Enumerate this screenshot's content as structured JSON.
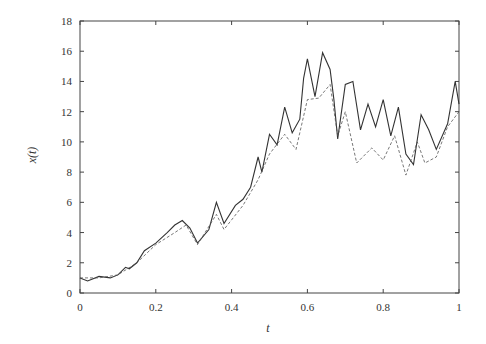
{
  "chart_data": {
    "type": "line",
    "title": "",
    "xlabel": "t",
    "ylabel": "x(t)",
    "xlim": [
      0,
      1
    ],
    "ylim": [
      0,
      18
    ],
    "grid": false,
    "legend": null,
    "x_ticks": [
      0,
      0.2,
      0.4,
      0.6,
      0.8,
      1
    ],
    "x_tick_labels": [
      "0",
      "0.2",
      "0.4",
      "0.6",
      "0.8",
      "1"
    ],
    "y_ticks": [
      0,
      2,
      4,
      6,
      8,
      10,
      12,
      14,
      16,
      18
    ],
    "y_tick_labels": [
      "0",
      "2",
      "4",
      "6",
      "8",
      "10",
      "12",
      "14",
      "16",
      "18"
    ],
    "series": [
      {
        "name": "solid",
        "style": "solid",
        "color": "#333333",
        "x": [
          0,
          0.02,
          0.05,
          0.08,
          0.1,
          0.12,
          0.13,
          0.15,
          0.17,
          0.2,
          0.23,
          0.25,
          0.27,
          0.29,
          0.31,
          0.34,
          0.36,
          0.38,
          0.41,
          0.43,
          0.45,
          0.47,
          0.48,
          0.5,
          0.52,
          0.54,
          0.56,
          0.58,
          0.59,
          0.6,
          0.62,
          0.64,
          0.66,
          0.67,
          0.68,
          0.7,
          0.72,
          0.74,
          0.76,
          0.78,
          0.8,
          0.82,
          0.84,
          0.86,
          0.88,
          0.9,
          0.92,
          0.94,
          0.97,
          0.99,
          1.0
        ],
        "values": [
          1.0,
          0.8,
          1.1,
          1.0,
          1.2,
          1.7,
          1.6,
          2.0,
          2.8,
          3.3,
          4.0,
          4.5,
          4.8,
          4.3,
          3.3,
          4.2,
          6.0,
          4.6,
          5.8,
          6.2,
          7.0,
          9.0,
          8.0,
          10.5,
          9.8,
          12.3,
          10.6,
          11.5,
          14.2,
          15.5,
          13.0,
          15.9,
          14.8,
          12.8,
          10.2,
          13.8,
          14.0,
          10.8,
          12.5,
          11.0,
          12.8,
          10.4,
          12.3,
          9.2,
          8.5,
          11.8,
          10.8,
          9.5,
          11.2,
          14.0,
          12.5
        ]
      },
      {
        "name": "dashed",
        "style": "dashed",
        "color": "#555555",
        "x": [
          0,
          0.05,
          0.1,
          0.15,
          0.2,
          0.25,
          0.28,
          0.31,
          0.36,
          0.38,
          0.43,
          0.47,
          0.5,
          0.54,
          0.57,
          0.6,
          0.63,
          0.66,
          0.68,
          0.7,
          0.73,
          0.77,
          0.8,
          0.83,
          0.86,
          0.89,
          0.91,
          0.94,
          0.97,
          1.0
        ],
        "values": [
          1.0,
          1.0,
          1.2,
          2.0,
          3.2,
          4.0,
          4.5,
          3.2,
          5.2,
          4.2,
          5.8,
          7.5,
          9.2,
          10.5,
          9.5,
          12.8,
          12.9,
          13.8,
          10.4,
          12.0,
          8.6,
          9.6,
          8.8,
          10.4,
          7.8,
          10.0,
          8.6,
          9.0,
          11.0,
          12.0
        ]
      }
    ]
  }
}
